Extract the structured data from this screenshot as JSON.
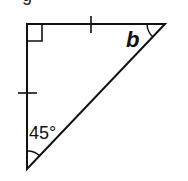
{
  "diagram": {
    "type": "right isosceles triangle",
    "top_glyph": "g",
    "angles": {
      "right_angle_marker": "top-left",
      "bottom_angle_label": "45°",
      "top_right_angle_label": "b"
    },
    "tick_marks": [
      "top side",
      "left side"
    ],
    "colors": {
      "stroke": "#111111",
      "background": "#ffffff"
    }
  }
}
